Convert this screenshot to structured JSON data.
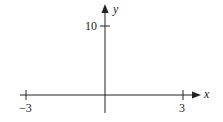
{
  "diagram": {
    "type": "coordinate-axes",
    "x_axis": {
      "label": "x",
      "ticks": [
        {
          "value": -3,
          "label": "−3"
        },
        {
          "value": 3,
          "label": "3"
        }
      ]
    },
    "y_axis": {
      "label": "y",
      "ticks": [
        {
          "value": 10,
          "label": "10"
        }
      ]
    },
    "colors": {
      "axis": "#222222",
      "background": "#ffffff"
    }
  }
}
